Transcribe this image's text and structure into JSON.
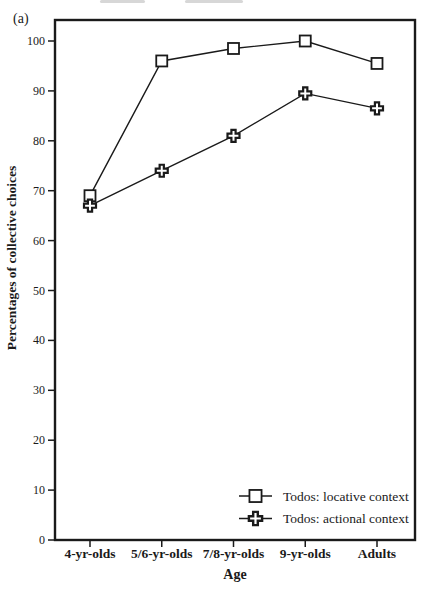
{
  "figure": {
    "panel_label": "(a)",
    "colors": {
      "ink": "#1a1a1a",
      "background": "#ffffff"
    }
  },
  "chart_data": {
    "type": "line",
    "title": "",
    "xlabel": "Age",
    "ylabel": "Percentages of collective choices",
    "categories": [
      "4-yr-olds",
      "5/6-yr-olds",
      "7/8-yr-olds",
      "9-yr-olds",
      "Adults"
    ],
    "series": [
      {
        "name": "Todos: locative context",
        "marker": "square",
        "values": [
          69,
          96,
          98.5,
          100,
          95.5
        ]
      },
      {
        "name": "Todos: actional context",
        "marker": "plus",
        "values": [
          67,
          74,
          81,
          89.5,
          86.5
        ]
      }
    ],
    "ylim": [
      0,
      100
    ],
    "yticks": [
      0,
      10,
      20,
      30,
      40,
      50,
      60,
      70,
      80,
      90,
      100
    ],
    "grid": false,
    "legend_position": "lower-right"
  }
}
